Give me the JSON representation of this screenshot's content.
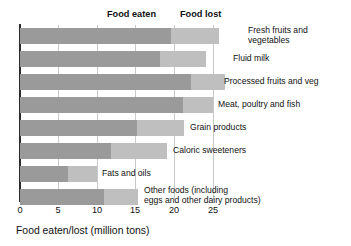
{
  "chart_data": {
    "type": "bar",
    "orientation": "horizontal",
    "stacked": true,
    "title": "",
    "xlabel": "Food eaten/lost (million tons)",
    "ylabel": "",
    "xlim": [
      0,
      27.5
    ],
    "xticks": [
      0,
      5,
      10,
      15,
      20,
      25
    ],
    "xtick_labels": [
      "0",
      "5",
      "10",
      "15",
      "20",
      "25"
    ],
    "grid": "vertical",
    "legend_position": "top-inside",
    "categories": [
      "Fresh fruits and\nvegetables",
      "Fluid milk",
      "Processed fruits and veg",
      "Meat, poultry and fish",
      "Grain products",
      "Caloric sweeteners",
      "Fats and oils",
      "Other foods (including\neggs and other dairy products)"
    ],
    "series": [
      {
        "name": "Food eaten",
        "color": "#9a9a9a",
        "values": [
          19.6,
          18.1,
          22.2,
          21.1,
          15.2,
          11.8,
          6.2,
          10.9
        ]
      },
      {
        "name": "Food lost",
        "color": "#bfbfbf",
        "values": [
          6.2,
          6.0,
          4.4,
          3.9,
          6.0,
          7.2,
          3.8,
          4.4
        ]
      }
    ],
    "totals": [
      25.8,
      24.1,
      26.6,
      25.0,
      21.2,
      19.0,
      10.0,
      15.3
    ]
  },
  "legend": {
    "eaten_label": "Food eaten",
    "lost_label": "Food lost"
  },
  "axis": {
    "title": "Food eaten/lost (million tons)",
    "ticks": [
      "0",
      "5",
      "10",
      "15",
      "20",
      "25"
    ]
  },
  "categories": [
    {
      "label": "Fresh fruits and\nvegetables"
    },
    {
      "label": "Fluid milk"
    },
    {
      "label": "Processed fruits and veg"
    },
    {
      "label": "Meat, poultry and fish"
    },
    {
      "label": "Grain products"
    },
    {
      "label": "Caloric sweeteners"
    },
    {
      "label": "Fats and oils"
    },
    {
      "label": "Other foods (including\neggs and other dairy products)"
    }
  ],
  "colors": {
    "eaten": "#9a9a9a",
    "lost": "#bfbfbf",
    "grid": "#c9c9c9",
    "axis": "#2b2b2b",
    "text": "#111111",
    "background": "#ffffff"
  }
}
